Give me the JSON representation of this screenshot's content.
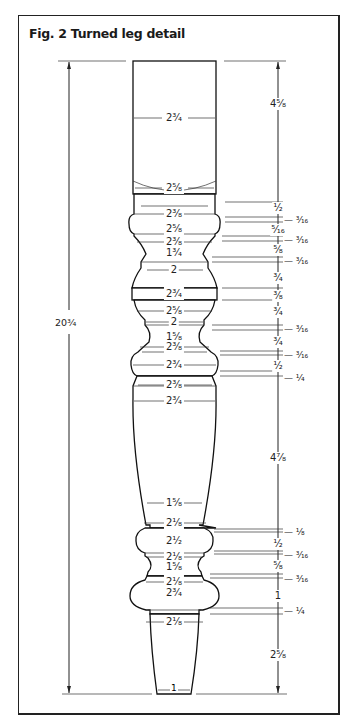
{
  "figure": {
    "title": "Fig. 2 Turned leg detail",
    "overall_height": "20³⁄₄",
    "bottom_width": "1",
    "diameters": [
      {
        "label": "2³⁄₄",
        "y": 118
      },
      {
        "label": "2⁵⁄₈",
        "y": 188
      },
      {
        "label": "2³⁄₈",
        "y": 214
      },
      {
        "label": "2⁵⁄₈",
        "y": 229
      },
      {
        "label": "2³⁄₈",
        "y": 242
      },
      {
        "label": "1³⁄₄",
        "y": 253
      },
      {
        "label": "2",
        "y": 270
      },
      {
        "label": "2³⁄₄",
        "y": 294
      },
      {
        "label": "2⁵⁄₈",
        "y": 311
      },
      {
        "label": "2",
        "y": 322
      },
      {
        "label": "1⁵⁄₈",
        "y": 337
      },
      {
        "label": "2³⁄₈",
        "y": 347
      },
      {
        "label": "2³⁄₄",
        "y": 365
      },
      {
        "label": "2³⁄₈",
        "y": 385
      },
      {
        "label": "2³⁄₄",
        "y": 401
      },
      {
        "label": "1⁵⁄₈",
        "y": 503
      },
      {
        "label": "2¹⁄₈",
        "y": 523
      },
      {
        "label": "2¹⁄₂",
        "y": 541
      },
      {
        "label": "2¹⁄₈",
        "y": 557
      },
      {
        "label": "1⁵⁄₈",
        "y": 567
      },
      {
        "label": "2¹⁄₈",
        "y": 582
      },
      {
        "label": "2³⁄₄",
        "y": 593
      },
      {
        "label": "2¹⁄₈",
        "y": 622
      }
    ],
    "heights": [
      {
        "label": "4⁵⁄₈",
        "y": 104
      },
      {
        "label": "¹⁄₂",
        "y": 208
      },
      {
        "label": "³⁄₁₆",
        "y": 220,
        "side": true
      },
      {
        "label": "⁵⁄₁₆",
        "y": 230
      },
      {
        "label": "³⁄₁₆",
        "y": 240,
        "side": true
      },
      {
        "label": "⁵⁄₈",
        "y": 250
      },
      {
        "label": "³⁄₁₆",
        "y": 261,
        "side": true
      },
      {
        "label": "³⁄₄",
        "y": 278
      },
      {
        "label": "³⁄₈",
        "y": 296
      },
      {
        "label": "³⁄₄",
        "y": 312
      },
      {
        "label": "³⁄₁₆",
        "y": 329,
        "side": true
      },
      {
        "label": "³⁄₄",
        "y": 342
      },
      {
        "label": "³⁄₁₆",
        "y": 355,
        "side": true
      },
      {
        "label": "¹⁄₂",
        "y": 366
      },
      {
        "label": "¹⁄₄",
        "y": 378,
        "side": true
      },
      {
        "label": "4⁷⁄₈",
        "y": 458
      },
      {
        "label": "¹⁄₈",
        "y": 532,
        "side": true
      },
      {
        "label": "¹⁄₂",
        "y": 544
      },
      {
        "label": "³⁄₁₆",
        "y": 555,
        "side": true
      },
      {
        "label": "⁵⁄₈",
        "y": 566
      },
      {
        "label": "³⁄₁₆",
        "y": 579,
        "side": true
      },
      {
        "label": "1",
        "y": 596
      },
      {
        "label": "¹⁄₄",
        "y": 611,
        "side": true
      },
      {
        "label": "2⁵⁄₈",
        "y": 655
      }
    ]
  }
}
